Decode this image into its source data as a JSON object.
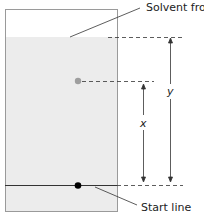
{
  "diagram": {
    "labels": {
      "solvent_front": "Solvent front",
      "start_line": "Start line",
      "x": "x",
      "y": "y"
    },
    "colors": {
      "paper_border": "#9a9a9a",
      "wet_region": "#ececec",
      "spot": "#9e9e9e",
      "start_dot": "#000000",
      "lines": "#333333"
    }
  }
}
